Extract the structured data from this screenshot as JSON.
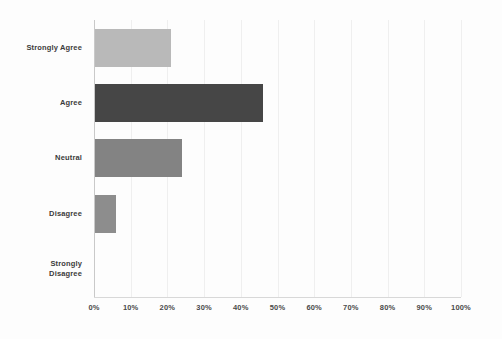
{
  "chart_data": {
    "type": "bar",
    "orientation": "horizontal",
    "title": "",
    "subtitle": "",
    "xlabel": "",
    "ylabel": "",
    "xlim": [
      0,
      100
    ],
    "grid": true,
    "legend": false,
    "legend_position": "none",
    "categories": [
      "Strongly Agree",
      "Agree",
      "Neutral",
      "Disagree",
      "Strongly\nDisagree"
    ],
    "values": [
      21,
      46,
      24,
      6,
      0
    ],
    "value_suffix": "%",
    "xticks": [
      0,
      10,
      20,
      30,
      40,
      50,
      60,
      70,
      80,
      90,
      100
    ],
    "xtick_labels": [
      "0%",
      "10%",
      "20%",
      "30%",
      "40%",
      "50%",
      "60%",
      "70%",
      "80%",
      "90%",
      "100%"
    ],
    "bar_colors": [
      "#b9b9b9",
      "#464646",
      "#838383",
      "#8d8d8d",
      "#8d8d8d"
    ],
    "bars": [
      {
        "label": "Strongly Agree",
        "value": 21,
        "color": "#b9b9b9"
      },
      {
        "label": "Agree",
        "value": 46,
        "color": "#464646"
      },
      {
        "label": "Neutral",
        "value": 24,
        "color": "#838383"
      },
      {
        "label": "Disagree",
        "value": 6,
        "color": "#8d8d8d"
      },
      {
        "label": "Strongly\nDisagree",
        "value": 0,
        "color": "#8d8d8d"
      }
    ]
  },
  "colors": {
    "background": "#fdfdfd",
    "axis": "#c9c9c9",
    "gridline": "#efefef",
    "label_text": "#3b3b3b",
    "tick_text": "#4a4a4a"
  }
}
